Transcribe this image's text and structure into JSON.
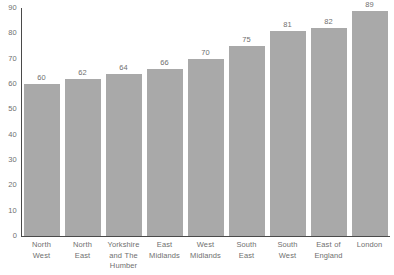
{
  "chart_data": {
    "type": "bar",
    "title": "",
    "subtitle": "",
    "xlabel": "",
    "ylabel": "",
    "ylim": [
      0,
      90
    ],
    "yticks": [
      0,
      10,
      20,
      30,
      40,
      50,
      60,
      70,
      80,
      90
    ],
    "grid": false,
    "legend": null,
    "bar_color": "#a9a9a9",
    "text_color": "#6f6f6f",
    "axis_color": "#4a4a4a",
    "show_value_labels": true,
    "categories": [
      "North West",
      "North East",
      "Yorkshire and The Humber",
      "East Midlands",
      "West Midlands",
      "South East",
      "South West",
      "East of England",
      "London"
    ],
    "category_lines": [
      [
        "North",
        "West"
      ],
      [
        "North",
        "East"
      ],
      [
        "Yorkshire",
        "and The",
        "Humber"
      ],
      [
        "East",
        "Midlands"
      ],
      [
        "West",
        "Midlands"
      ],
      [
        "South",
        "East"
      ],
      [
        "South",
        "West"
      ],
      [
        "East of",
        "England"
      ],
      [
        "London"
      ]
    ],
    "values": [
      60,
      62,
      64,
      66,
      70,
      75,
      81,
      82,
      89
    ],
    "value_labels": [
      "60",
      "62",
      "64",
      "66",
      "70",
      "75",
      "81",
      "82",
      "89"
    ]
  }
}
